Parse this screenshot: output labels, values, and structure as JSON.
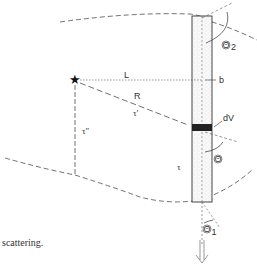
{
  "diagram": {
    "labels": {
      "distance_L": "L",
      "path_R": "R",
      "tau_prime": "τ′",
      "tau_double_prime": "τ″",
      "tau": "τ",
      "offset_b": "b",
      "volume_dV": "dV",
      "theta_scatter": "Θ",
      "theta_2": "Θ",
      "theta_2_sub": "2",
      "theta_1": "Θ",
      "theta_1_sub": "1"
    },
    "colors": {
      "line": "#333333",
      "stipple": "#bbbbbb",
      "dv_block": "#222222"
    }
  },
  "caption": {
    "text": "scattering."
  }
}
